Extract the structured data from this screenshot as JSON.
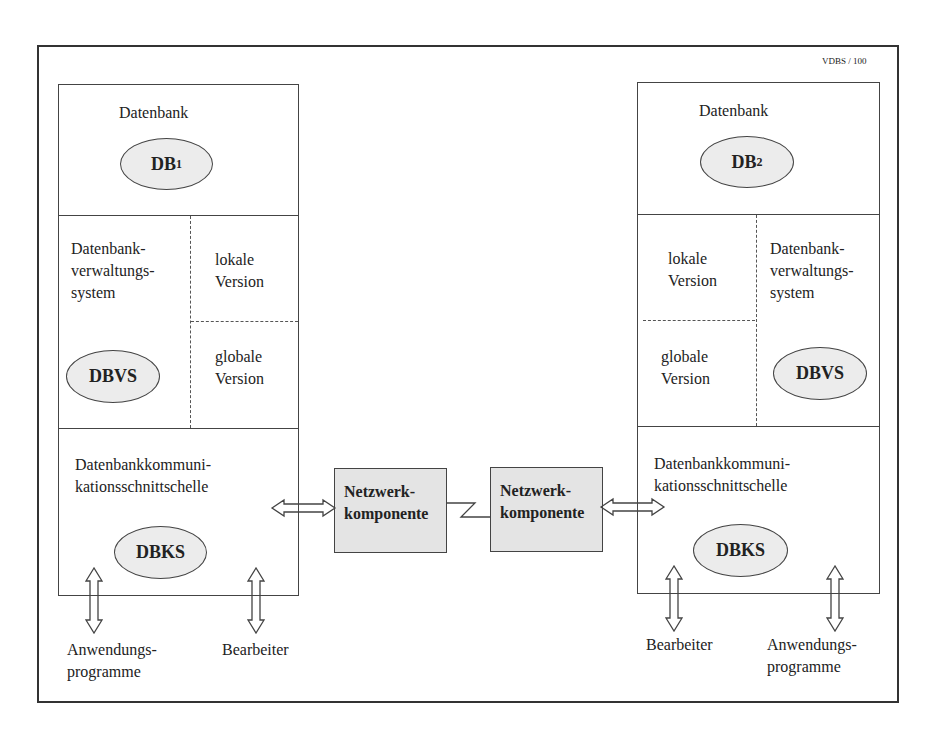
{
  "page_label": "VDBS / 100",
  "left_node": {
    "db_section": {
      "title": "Datenbank",
      "ellipse": "DB",
      "subscript": "1"
    },
    "dbvs_section": {
      "title_lines": [
        "Datenbank-",
        "verwaltungs-",
        "system"
      ],
      "ellipse": "DBVS",
      "local_version": [
        "lokale",
        "Version"
      ],
      "global_version": [
        "globale",
        "Version"
      ]
    },
    "dbks_section": {
      "title_lines": [
        "Datenbankkommuni-",
        "kationsschnittschelle"
      ],
      "ellipse": "DBKS"
    },
    "below_labels": {
      "applications": [
        "Anwendungs-",
        "programme"
      ],
      "operator": "Bearbeiter"
    }
  },
  "right_node": {
    "db_section": {
      "title": "Datenbank",
      "ellipse": "DB",
      "subscript": "2"
    },
    "dbvs_section": {
      "title_lines": [
        "Datenbank-",
        "verwaltungs-",
        "system"
      ],
      "ellipse": "DBVS",
      "local_version": [
        "lokale",
        "Version"
      ],
      "global_version": [
        "globale",
        "Version"
      ]
    },
    "dbks_section": {
      "title_lines": [
        "Datenbankkommuni-",
        "kationsschnittschelle"
      ],
      "ellipse": "DBKS"
    },
    "below_labels": {
      "operator": "Bearbeiter",
      "applications": [
        "Anwendungs-",
        "programme"
      ]
    }
  },
  "network": {
    "left_component": [
      "Netzwerk-",
      "komponente"
    ],
    "right_component": [
      "Netzwerk-",
      "komponente"
    ],
    "link": "zigzag-link"
  }
}
